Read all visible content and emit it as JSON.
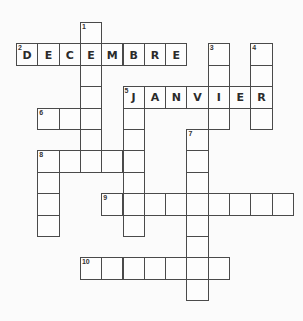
{
  "puzzle": {
    "type": "crossword",
    "words": [
      {
        "number": "1",
        "direction": "down",
        "row": 0,
        "col": 3,
        "length": 7,
        "answer": ""
      },
      {
        "number": "2",
        "direction": "across",
        "row": 1,
        "col": 0,
        "length": 8,
        "answer": "DECEMBRE"
      },
      {
        "number": "3",
        "direction": "down",
        "row": 1,
        "col": 9,
        "length": 4,
        "answer": ""
      },
      {
        "number": "4",
        "direction": "down",
        "row": 1,
        "col": 11,
        "length": 4,
        "answer": ""
      },
      {
        "number": "5",
        "direction": "across",
        "row": 3,
        "col": 5,
        "length": 7,
        "answer": "JANVIER"
      },
      {
        "number": "5",
        "direction": "down",
        "row": 3,
        "col": 5,
        "length": 7,
        "answer": ""
      },
      {
        "number": "6",
        "direction": "across",
        "row": 4,
        "col": 1,
        "length": 3,
        "answer": ""
      },
      {
        "number": "7",
        "direction": "down",
        "row": 5,
        "col": 8,
        "length": 8,
        "answer": ""
      },
      {
        "number": "8",
        "direction": "across",
        "row": 6,
        "col": 1,
        "length": 5,
        "answer": ""
      },
      {
        "number": "8",
        "direction": "down",
        "row": 6,
        "col": 1,
        "length": 4,
        "answer": ""
      },
      {
        "number": "9",
        "direction": "across",
        "row": 8,
        "col": 4,
        "length": 9,
        "answer": ""
      },
      {
        "number": "10",
        "direction": "across",
        "row": 11,
        "col": 3,
        "length": 7,
        "answer": ""
      }
    ]
  }
}
